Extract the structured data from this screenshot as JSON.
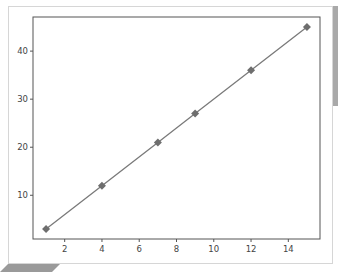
{
  "chart_data": {
    "type": "line",
    "title": "",
    "xlabel": "",
    "ylabel": "",
    "x": [
      1,
      4,
      7,
      9,
      12,
      15
    ],
    "series": [
      {
        "name": "",
        "values": [
          3,
          12,
          21,
          27,
          36,
          45
        ],
        "color": "#7a7a7a",
        "marker": "diamond"
      }
    ],
    "xlim": [
      0.3,
      15.7
    ],
    "ylim": [
      0.9,
      47.1
    ],
    "xticks": [
      2,
      4,
      6,
      8,
      10,
      12,
      14
    ],
    "yticks": [
      10,
      20,
      30,
      40
    ],
    "grid": false,
    "legend": null
  }
}
